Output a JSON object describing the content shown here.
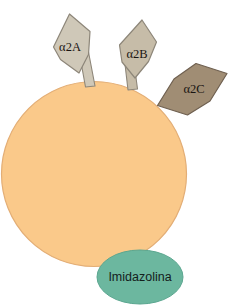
{
  "diagram": {
    "background_color": "#ffffff",
    "cell": {
      "name": "cell-body",
      "fill_color": "#fac98a",
      "stroke_color": "#e0a96d",
      "center_x": 94,
      "center_y": 174,
      "radius": 93
    },
    "receptors": [
      {
        "id": "a2a",
        "label": "α2A",
        "fill_color": "#cfc8b8",
        "stroke_color": "#8d8679",
        "label_x": 70,
        "label_y": 48
      },
      {
        "id": "a2b",
        "label": "α2B",
        "fill_color": "#c6bca8",
        "stroke_color": "#8d8679",
        "label_x": 137,
        "label_y": 55
      },
      {
        "id": "a2c",
        "label": "α2C",
        "fill_color": "#a08d74",
        "stroke_color": "#6f6050",
        "label_x": 194,
        "label_y": 90
      }
    ],
    "ligand_site": {
      "id": "imidazoline",
      "label": "Imidazolina",
      "fill_color": "#6cb79f",
      "stroke_color": "#4e9a84",
      "center_x": 140,
      "center_y": 277,
      "radius_x": 43,
      "radius_y": 27,
      "label_x": 140,
      "label_y": 278
    }
  }
}
